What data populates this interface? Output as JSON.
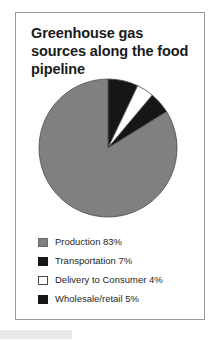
{
  "figure": {
    "title": "Greenhouse gas sources along the food pipeline"
  },
  "colors": {
    "production": "#808080",
    "transportation": "#161616",
    "delivery": "#ffffff",
    "wholesale": "#161616",
    "slice_outline": "#4a4a4a",
    "frame": "#9a9a9a",
    "text": "#1a1a1a",
    "artifact": "#e8e8e8"
  },
  "legend": {
    "items": [
      {
        "label": "Production 83%",
        "swatch": "#808080",
        "swatch_border": "#6a6a6a"
      },
      {
        "label": "Transportation 7%",
        "swatch": "#161616",
        "swatch_border": "#161616"
      },
      {
        "label": "Delivery to Consumer 4%",
        "swatch": "#ffffff",
        "swatch_border": "#4a4a4a"
      },
      {
        "label": "Wholesale/retail 5%",
        "swatch": "#161616",
        "swatch_border": "#161616"
      }
    ]
  },
  "chart_data": {
    "type": "pie",
    "title": "Greenhouse gas sources along the food pipeline",
    "xlabel": "",
    "ylabel": "",
    "legend_position": "bottom-left",
    "start_angle_deg": 0,
    "direction": "clockwise",
    "categories": [
      "Transportation",
      "Delivery to Consumer",
      "Wholesale/retail",
      "Production"
    ],
    "values": [
      7,
      4,
      5,
      83
    ],
    "unit": "percent",
    "slices": [
      {
        "name": "Transportation",
        "value": 7,
        "color": "#161616"
      },
      {
        "name": "Delivery to Consumer",
        "value": 4,
        "color": "#ffffff"
      },
      {
        "name": "Wholesale/retail",
        "value": 5,
        "color": "#161616"
      },
      {
        "name": "Production",
        "value": 83,
        "color": "#808080"
      }
    ]
  }
}
